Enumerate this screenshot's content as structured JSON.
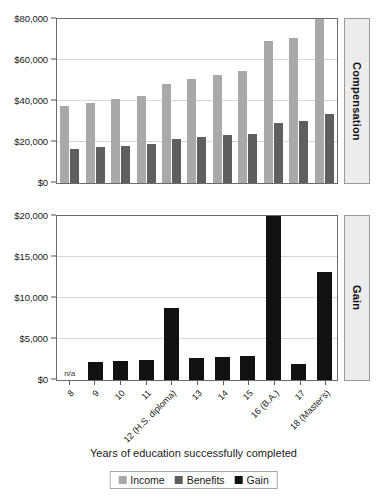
{
  "figure": {
    "axis_title": "Years of education successfully completed",
    "legend": {
      "items": [
        {
          "label": "Income",
          "color": "#a9a9a9"
        },
        {
          "label": "Benefits",
          "color": "#5f5f5f"
        },
        {
          "label": "Gain",
          "color": "#111111"
        }
      ]
    }
  },
  "panels": {
    "top": {
      "side_label": "Compensation"
    },
    "bottom": {
      "side_label": "Gain",
      "na_label": "n/a"
    }
  },
  "chart_data": [
    {
      "type": "bar",
      "title": "Compensation",
      "panel": "top",
      "xlabel": "Years of education successfully completed",
      "ylabel": "Compensation",
      "ylim": [
        0,
        80000
      ],
      "yticks": [
        0,
        20000,
        40000,
        60000,
        80000
      ],
      "ytick_labels": [
        "$0",
        "$20,000",
        "$40,000",
        "$60,000",
        "$80,000"
      ],
      "grid": true,
      "legend_position": "bottom",
      "categories": [
        "8",
        "9",
        "10",
        "11",
        "12 (H.S. diploma)",
        "13",
        "14",
        "15",
        "16 (B.A.)",
        "17",
        "18 (Master's)"
      ],
      "series": [
        {
          "name": "Income",
          "color": "#a9a9a9",
          "values": [
            37500,
            39200,
            40800,
            42400,
            48500,
            50500,
            52600,
            54800,
            69200,
            70700,
            80500
          ]
        },
        {
          "name": "Benefits",
          "color": "#5f5f5f",
          "values": [
            16800,
            17500,
            18300,
            19000,
            21700,
            22400,
            23300,
            24100,
            29500,
            30200,
            33600
          ]
        }
      ]
    },
    {
      "type": "bar",
      "title": "Gain",
      "panel": "bottom",
      "xlabel": "Years of education successfully completed",
      "ylabel": "Gain",
      "ylim": [
        0,
        20000
      ],
      "yticks": [
        0,
        5000,
        10000,
        15000,
        20000
      ],
      "ytick_labels": [
        "$0",
        "$5,000",
        "$10,000",
        "$15,000",
        "$20,000"
      ],
      "grid": true,
      "legend_position": "bottom",
      "categories": [
        "8",
        "9",
        "10",
        "11",
        "12 (H.S. diploma)",
        "13",
        "14",
        "15",
        "16 (B.A.)",
        "17",
        "18 (Master's)"
      ],
      "series": [
        {
          "name": "Gain",
          "color": "#111111",
          "values": [
            null,
            2250,
            2350,
            2500,
            8800,
            2650,
            2800,
            2900,
            20100,
            1950,
            13200
          ]
        }
      ],
      "annotations": [
        {
          "category": "8",
          "text": "n/a"
        }
      ]
    }
  ]
}
